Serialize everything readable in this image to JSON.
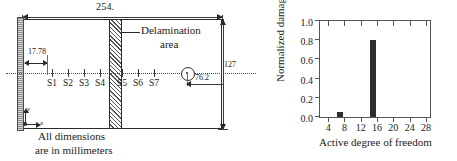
{
  "diagram": {
    "overall_length_label": "254.",
    "offset_label": "17.78",
    "impact_distance_label": "76.2",
    "width_label": "127",
    "delamination_label_line1": "Delamination",
    "delamination_label_line2": "area",
    "note_line1": "All dimensions",
    "note_line2": "are in millimeters",
    "axis_x_label": "x",
    "axis_y_label": "y",
    "sensors": [
      {
        "label": "S1",
        "x": 52
      },
      {
        "label": "S2",
        "x": 68
      },
      {
        "label": "S3",
        "x": 84
      },
      {
        "label": "S4",
        "x": 100
      },
      {
        "label": "S5",
        "x": 122
      },
      {
        "label": "S6",
        "x": 138
      },
      {
        "label": "S7",
        "x": 154
      }
    ]
  },
  "chart_data": {
    "type": "bar",
    "title": "",
    "xlabel": "Active degree of freedom",
    "ylabel": "Normalized damage force",
    "xlim": [
      2,
      29
    ],
    "ylim": [
      0.0,
      1.0
    ],
    "grid": false,
    "legend": null,
    "xticks": [
      4,
      8,
      12,
      16,
      20,
      24,
      28
    ],
    "xticklabels": [
      "4",
      "8",
      "12",
      "16",
      "20",
      "24",
      "28"
    ],
    "yticks": [
      0.0,
      0.2,
      0.4,
      0.6,
      0.8,
      1.0
    ],
    "yticklabels": [
      "0.0",
      "0.2",
      "0.4",
      "0.6",
      "0.8",
      "1.0"
    ],
    "bar_color": "#2e2e2e",
    "x": [
      7,
      15
    ],
    "values": [
      0.05,
      0.8
    ],
    "categories": [
      "7",
      "15"
    ]
  }
}
